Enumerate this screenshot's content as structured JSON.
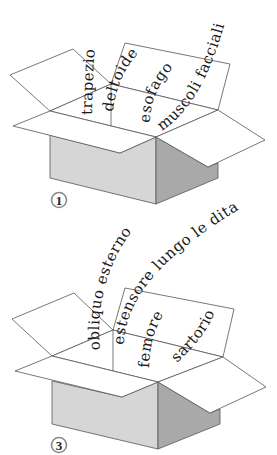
{
  "figure": {
    "colors": {
      "background": "#ffffff",
      "box_left_face": "#d6d6d6",
      "box_right_face": "#a9a9a9",
      "outline": "#555555",
      "text": "#1a1a1a"
    },
    "boxes": [
      {
        "label": "1",
        "words": [
          "trapezio",
          "deltoide",
          "esofago",
          "muscoli facciali"
        ]
      },
      {
        "label": "3",
        "words": [
          "obliquo esterno",
          "estensore lungo le dita",
          "femore",
          "sartorio"
        ]
      }
    ]
  }
}
